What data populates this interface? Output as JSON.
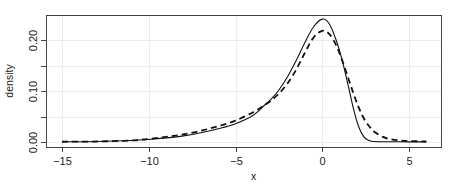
{
  "chart_data": {
    "type": "line",
    "title": "",
    "xlabel": "x",
    "ylabel": "density",
    "xlim": [
      -15.6,
      6.6
    ],
    "ylim": [
      -0.01,
      0.248
    ],
    "grid": true,
    "legend": null,
    "x_ticks": [
      -15,
      -10,
      -5,
      0,
      5
    ],
    "x_tick_labels": [
      "−15",
      "−10",
      "−5",
      "0",
      "5"
    ],
    "y_ticks": [
      0.0,
      0.05,
      0.1,
      0.15,
      0.2
    ],
    "y_tick_labels": [
      "0.00",
      "",
      "0.10",
      "",
      "0.20"
    ],
    "series": [
      {
        "name": "solid",
        "style": "solid",
        "color": "#111111",
        "x": [
          -15,
          -13,
          -11,
          -10,
          -9,
          -8,
          -7,
          -6,
          -5,
          -4,
          -3.3,
          -3,
          -2.5,
          -2,
          -1.5,
          -1,
          -0.5,
          0,
          0.4,
          0.8,
          1.15,
          1.5,
          1.8,
          2.1,
          2.4,
          2.7,
          3,
          4,
          5,
          6
        ],
        "y": [
          0.0005,
          0.001,
          0.003,
          0.005,
          0.008,
          0.012,
          0.018,
          0.026,
          0.036,
          0.052,
          0.073,
          0.082,
          0.102,
          0.128,
          0.16,
          0.195,
          0.226,
          0.241,
          0.232,
          0.2,
          0.16,
          0.11,
          0.065,
          0.03,
          0.01,
          0.003,
          0.001,
          0.0005,
          0.0003,
          0.0002
        ]
      },
      {
        "name": "dashed",
        "style": "dashed",
        "color": "#111111",
        "x": [
          -15,
          -13,
          -11,
          -10,
          -9,
          -8,
          -7,
          -6,
          -5,
          -4,
          -3.3,
          -3,
          -2.5,
          -2,
          -1.5,
          -1,
          -0.5,
          0,
          0.4,
          0.8,
          1.15,
          1.5,
          1.8,
          2.1,
          2.4,
          2.7,
          3,
          3.5,
          4,
          4.5,
          5,
          6
        ],
        "y": [
          0.0005,
          0.001,
          0.003,
          0.006,
          0.01,
          0.015,
          0.022,
          0.031,
          0.042,
          0.058,
          0.073,
          0.08,
          0.095,
          0.115,
          0.142,
          0.175,
          0.205,
          0.218,
          0.212,
          0.19,
          0.16,
          0.125,
          0.095,
          0.068,
          0.046,
          0.031,
          0.02,
          0.01,
          0.005,
          0.003,
          0.002,
          0.001
        ]
      }
    ]
  },
  "plot_area": {
    "left": 46,
    "top": 15,
    "right": 441,
    "bottom": 147
  },
  "colors": {
    "axis": "#444444",
    "grid": "#ececec",
    "line": "#111111"
  }
}
